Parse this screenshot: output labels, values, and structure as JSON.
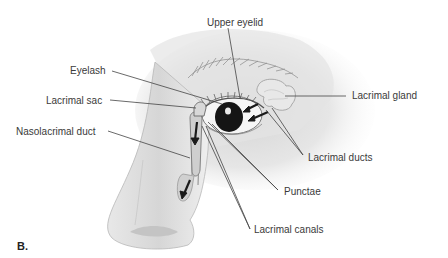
{
  "diagram": {
    "panel_label": "B.",
    "labels": [
      {
        "id": "upper-eyelid",
        "text": "Upper eyelid"
      },
      {
        "id": "eyelash",
        "text": "Eyelash"
      },
      {
        "id": "lacrimal-sac",
        "text": "Lacrimal sac"
      },
      {
        "id": "nasolacrimal-duct",
        "text": "Nasolacrimal duct"
      },
      {
        "id": "lacrimal-gland",
        "text": "Lacrimal gland"
      },
      {
        "id": "lacrimal-ducts",
        "text": "Lacrimal ducts"
      },
      {
        "id": "punctae",
        "text": "Punctae"
      },
      {
        "id": "lacrimal-canals",
        "text": "Lacrimal canals"
      }
    ],
    "colors": {
      "leader_line": "#444444",
      "text": "#3a3a3a",
      "skin_shade": "#d9d9d9",
      "arrow": "#1a1a1a"
    }
  }
}
